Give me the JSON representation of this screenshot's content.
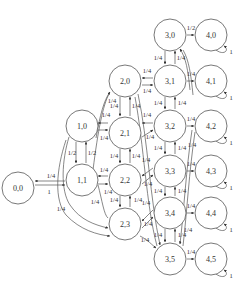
{
  "diagram": {
    "type": "state-transition-diagram",
    "colors": {
      "stroke": "#555555",
      "text": "#333333",
      "background": "#ffffff"
    },
    "nodes": [
      {
        "id": "0,0",
        "label": "0,0",
        "x": 18,
        "y": 188
      },
      {
        "id": "1,0",
        "label": "1,0",
        "x": 82,
        "y": 126
      },
      {
        "id": "1,1",
        "label": "1,1",
        "x": 82,
        "y": 180
      },
      {
        "id": "2,0",
        "label": "2,0",
        "x": 125,
        "y": 81
      },
      {
        "id": "2,1",
        "label": "2,1",
        "x": 125,
        "y": 133
      },
      {
        "id": "2,2",
        "label": "2,2",
        "x": 125,
        "y": 180
      },
      {
        "id": "2,3",
        "label": "2,3",
        "x": 125,
        "y": 224
      },
      {
        "id": "3,0",
        "label": "3,0",
        "x": 170,
        "y": 35
      },
      {
        "id": "3,1",
        "label": "3,1",
        "x": 170,
        "y": 81
      },
      {
        "id": "3,2",
        "label": "3,2",
        "x": 170,
        "y": 126
      },
      {
        "id": "3,3",
        "label": "3,3",
        "x": 170,
        "y": 171
      },
      {
        "id": "3,4",
        "label": "3,4",
        "x": 170,
        "y": 213
      },
      {
        "id": "3,5",
        "label": "3,5",
        "x": 170,
        "y": 259
      },
      {
        "id": "4,0",
        "label": "4,0",
        "x": 211,
        "y": 35
      },
      {
        "id": "4,1",
        "label": "4,1",
        "x": 211,
        "y": 81
      },
      {
        "id": "4,2",
        "label": "4,2",
        "x": 211,
        "y": 126
      },
      {
        "id": "4,3",
        "label": "4,3",
        "x": 211,
        "y": 171
      },
      {
        "id": "4,4",
        "label": "4,4",
        "x": 211,
        "y": 213
      },
      {
        "id": "4,5",
        "label": "4,5",
        "x": 211,
        "y": 259
      }
    ],
    "edge_labels": {
      "e_00_11": "1",
      "e_11_00": "1/4",
      "e_10_11": "1/2",
      "e_11_10": "1/2",
      "e_21_10": "1/4",
      "e_10_21": "1/4",
      "e_22_11": "1/4",
      "e_11_22": "1/4",
      "e_00_23_a": "1/4",
      "e_00_23_b": "1/4",
      "e_20_21": "1/4",
      "e_21_20": "1/4",
      "e_21_22": "1/4",
      "e_22_21": "1/4",
      "e_22_23": "1/4",
      "e_23_22": "1/4",
      "e_10_20": "1/4",
      "e_31_20": "1/4",
      "e_20_31": "1/4",
      "e_32_21": "1/4",
      "e_21_32": "1/4",
      "e_33_22": "1/4",
      "e_22_33": "1/4",
      "e_34_23": "1/4",
      "e_23_34": "1/4",
      "e_30_31": "1/4",
      "e_31_30": "1/4",
      "e_31_32": "1/4",
      "e_32_31": "1/4",
      "e_32_33": "1/4",
      "e_33_32": "1/4",
      "e_33_34": "1/4",
      "e_34_33": "1/4",
      "e_34_35": "1/4",
      "e_35_34": "1/4",
      "e_30_40": "1/2",
      "e_31_41": "1/4",
      "e_32_42": "1/4",
      "e_33_43": "1/4",
      "e_34_44": "1/4",
      "e_35_45": "1/4",
      "e_23_35": "1/4",
      "e_41_30": "1/4",
      "e_42_31": "1/4",
      "e_44_35": "1/4",
      "loop_40": "1",
      "loop_41": "1",
      "loop_42": "1",
      "loop_43": "1",
      "loop_44": "1",
      "loop_45": "1"
    }
  }
}
